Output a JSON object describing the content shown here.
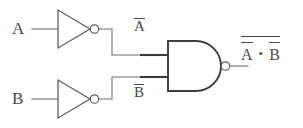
{
  "diagram": {
    "type": "logic-circuit",
    "colors": {
      "background": "#ffffff",
      "wire": "#6f6f6f",
      "wire_highlight": "#3a3a3a",
      "gate_stroke": "#5d5d5d",
      "gate_stroke_dark": "#3d3d3d",
      "text": "#4a4a4a"
    }
  },
  "inputs": [
    {
      "label": "A",
      "name": "input-a"
    },
    {
      "label": "B",
      "name": "input-b"
    }
  ],
  "gates": [
    {
      "name": "not-gate-a",
      "type": "NOT",
      "input": "A",
      "output": "A"
    },
    {
      "name": "not-gate-b",
      "type": "NOT",
      "input": "B",
      "output": "B"
    },
    {
      "name": "nand-gate",
      "type": "NAND",
      "inputs": [
        "A",
        "B"
      ]
    }
  ],
  "intermediate_labels": [
    {
      "name": "label-not-a",
      "base": "A",
      "overbar": true,
      "text": "A"
    },
    {
      "name": "label-not-b",
      "base": "B",
      "overbar": true,
      "text": "B"
    }
  ],
  "output": {
    "name": "output-expression",
    "left_term": "A",
    "operator": "•",
    "right_term": "B",
    "left_term_overbar": true,
    "right_term_overbar": true,
    "outer_overbar": true,
    "plain_text": "not(notA . notB)"
  }
}
